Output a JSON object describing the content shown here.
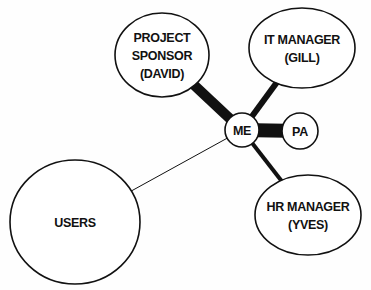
{
  "diagram": {
    "type": "stakeholder-relationship-map",
    "nodes": [
      {
        "id": "sponsor",
        "lines": [
          "PROJECT",
          "SPONSOR",
          "(DAVID)"
        ],
        "shape": "ellipse",
        "cx": 162,
        "cy": 55,
        "rx": 47,
        "ry": 42
      },
      {
        "id": "it",
        "lines": [
          "IT MANAGER",
          "(GILL)"
        ],
        "shape": "ellipse",
        "cx": 302,
        "cy": 48,
        "rx": 53,
        "ry": 40
      },
      {
        "id": "me",
        "lines": [
          "ME"
        ],
        "shape": "circle",
        "cx": 242,
        "cy": 130,
        "rx": 17,
        "ry": 17
      },
      {
        "id": "pa",
        "lines": [
          "PA"
        ],
        "shape": "circle",
        "cx": 300,
        "cy": 131,
        "rx": 18,
        "ry": 18
      },
      {
        "id": "hr",
        "lines": [
          "HR MANAGER",
          "(YVES)"
        ],
        "shape": "ellipse",
        "cx": 308,
        "cy": 215,
        "rx": 53,
        "ry": 40
      },
      {
        "id": "users",
        "lines": [
          "USERS"
        ],
        "shape": "ellipse",
        "cx": 75,
        "cy": 222,
        "rx": 65,
        "ry": 62
      }
    ],
    "edges": [
      {
        "from": "me",
        "to": "sponsor",
        "strength": "very strong",
        "width": 10
      },
      {
        "from": "me",
        "to": "it",
        "strength": "strong",
        "width": 6
      },
      {
        "from": "me",
        "to": "pa",
        "strength": "very strong",
        "width": 14
      },
      {
        "from": "me",
        "to": "hr",
        "strength": "medium",
        "width": 4
      },
      {
        "from": "me",
        "to": "users",
        "strength": "weak",
        "width": 1
      }
    ]
  },
  "colors": {
    "stroke": "#111111",
    "fill": "#ffffff",
    "text": "#111111"
  }
}
